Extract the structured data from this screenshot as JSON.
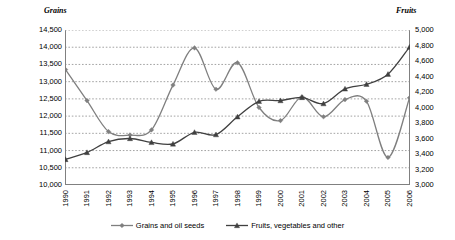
{
  "chart_data": {
    "type": "line",
    "title": "",
    "xlabel": "",
    "grid": true,
    "legend_position": "bottom",
    "x": [
      1990,
      1991,
      1992,
      1993,
      1994,
      1995,
      1996,
      1997,
      1998,
      1999,
      2000,
      2001,
      2002,
      2003,
      2004,
      2005,
      2006
    ],
    "axes": {
      "left": {
        "label": "Grains",
        "ylim": [
          10000,
          14500
        ],
        "ticks": [
          "10,000",
          "10,500",
          "11,000",
          "11,500",
          "12,000",
          "12,500",
          "13,000",
          "13,500",
          "14,000",
          "14,500"
        ],
        "tick_values": [
          10000,
          10500,
          11000,
          11500,
          12000,
          12500,
          13000,
          13500,
          14000,
          14500
        ]
      },
      "right": {
        "label": "Fruits",
        "ylim": [
          3000,
          5000
        ],
        "ticks": [
          "3,000",
          "3,200",
          "3,400",
          "3,600",
          "3,800",
          "4,000",
          "4,200",
          "4,400",
          "4,600",
          "4,800",
          "5,000"
        ],
        "tick_values": [
          3000,
          3200,
          3400,
          3600,
          3800,
          4000,
          4200,
          4400,
          4600,
          4800,
          5000
        ]
      }
    },
    "xticks": [
      "1990",
      "1991",
      "1992",
      "1993",
      "1994",
      "1995",
      "1996",
      "1997",
      "1998",
      "1999",
      "2000",
      "2001",
      "2002",
      "2003",
      "2004",
      "2005",
      "2006"
    ],
    "series": [
      {
        "name": "Grains and oil seeds",
        "axis": "left",
        "marker": "diamond",
        "color": "#7f7f7f",
        "values": [
          13350,
          12450,
          11550,
          11450,
          11600,
          12900,
          13980,
          12780,
          13550,
          12250,
          11870,
          12560,
          11980,
          12480,
          12430,
          10800,
          12530
        ]
      },
      {
        "name": "Fruits, vegetables and other",
        "axis": "right",
        "marker": "triangle",
        "color": "#404040",
        "values": [
          3330,
          3420,
          3560,
          3600,
          3550,
          3530,
          3680,
          3650,
          3880,
          4080,
          4090,
          4130,
          4050,
          4240,
          4300,
          4430,
          4780
        ]
      }
    ]
  },
  "legend": {
    "items": [
      {
        "label": "Grains and oil seeds",
        "marker": "diamond",
        "color": "#7f7f7f"
      },
      {
        "label": "Fruits, vegetables and other",
        "marker": "triangle",
        "color": "#404040"
      }
    ]
  },
  "colors": {
    "grid": "#8c8c8c",
    "axis": "#808080",
    "background": "#ffffff",
    "text": "#000000"
  }
}
